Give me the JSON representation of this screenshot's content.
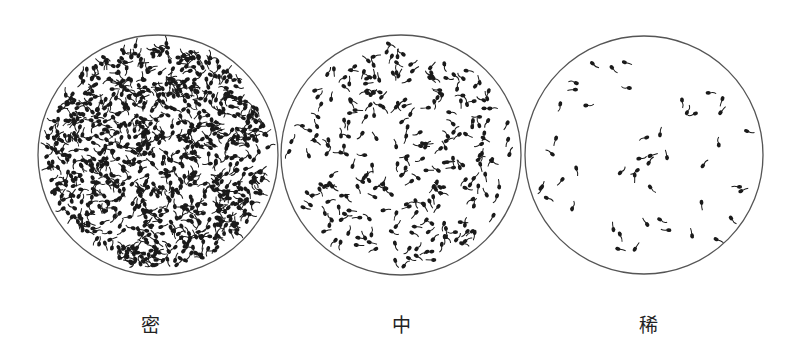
{
  "figure": {
    "background": "#ffffff",
    "circle_stroke": "#555555",
    "particle_color": "#1a1a1a",
    "panels": [
      {
        "id": "dense",
        "label": "密",
        "cx": 158,
        "cy": 155,
        "r": 120,
        "count": 900,
        "label_x": 150,
        "label_y": 310
      },
      {
        "id": "medium",
        "label": "中",
        "cx": 401,
        "cy": 155,
        "r": 120,
        "count": 260,
        "label_x": 401,
        "label_y": 310
      },
      {
        "id": "sparse",
        "label": "稀",
        "cx": 644,
        "cy": 155,
        "r": 119,
        "count": 48,
        "label_x": 648,
        "label_y": 310
      }
    ]
  }
}
